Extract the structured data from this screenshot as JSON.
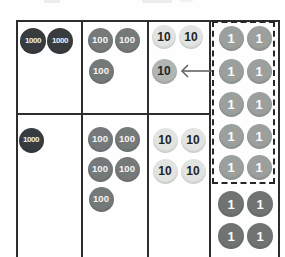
{
  "palette": {
    "background": "#fefefe",
    "table_border": "#2d2d2d",
    "dashed_box_border": "#262626",
    "arrow": "#666666",
    "disk_kinds": {
      "thousand": {
        "bg": "#383c3e",
        "fg": "#f2f2f2",
        "font_px": 8
      },
      "hundred": {
        "bg": "#75797a",
        "fg": "#f5f5f5",
        "font_px": 9.5
      },
      "ten": {
        "bg": "#e2e4e2",
        "fg": "#222526",
        "font_px": 12
      },
      "ten_moved": {
        "bg": "#b2b6b3",
        "fg": "#222526",
        "font_px": 12
      },
      "one_light": {
        "bg": "#9ba09d",
        "fg": "#fdfdfd",
        "font_px": 13
      },
      "one_dark": {
        "bg": "#6f7472",
        "fg": "#fdfdfd",
        "font_px": 13
      }
    }
  },
  "chart": {
    "type": "place-value-disk-diagram",
    "columns": [
      "thousands",
      "hundreds",
      "tens",
      "ones"
    ],
    "rows": [
      {
        "thousands": 2,
        "hundreds": 3,
        "tens": 2,
        "tens_regrouped_in": 1,
        "ones_in_dashed_box": 10
      },
      {
        "thousands": 1,
        "hundreds": 5,
        "tens": 4,
        "ones": 4
      }
    ],
    "dashed_box_note": "ten ones grouped, arrow shows regrouping into one ten"
  },
  "disks": [
    {
      "label": "1000",
      "kind": "thousand",
      "cx": 33,
      "cy": 41,
      "d": 26
    },
    {
      "label": "1000",
      "kind": "thousand",
      "cx": 60,
      "cy": 41,
      "d": 26
    },
    {
      "label": "100",
      "kind": "hundred",
      "cx": 100,
      "cy": 40,
      "d": 25
    },
    {
      "label": "100",
      "kind": "hundred",
      "cx": 127,
      "cy": 40,
      "d": 25
    },
    {
      "label": "100",
      "kind": "hundred",
      "cx": 101,
      "cy": 71,
      "d": 25
    },
    {
      "label": "10",
      "kind": "ten",
      "cx": 164,
      "cy": 37,
      "d": 24
    },
    {
      "label": "10",
      "kind": "ten",
      "cx": 191,
      "cy": 37,
      "d": 24
    },
    {
      "label": "10",
      "kind": "ten_moved",
      "cx": 164,
      "cy": 71,
      "d": 25
    },
    {
      "label": "1",
      "kind": "one_light",
      "cx": 231,
      "cy": 38,
      "d": 25
    },
    {
      "label": "1",
      "kind": "one_light",
      "cx": 259,
      "cy": 38,
      "d": 25
    },
    {
      "label": "1",
      "kind": "one_light",
      "cx": 231,
      "cy": 71,
      "d": 25
    },
    {
      "label": "1",
      "kind": "one_light",
      "cx": 259,
      "cy": 71,
      "d": 25
    },
    {
      "label": "1",
      "kind": "one_light",
      "cx": 231,
      "cy": 104,
      "d": 25
    },
    {
      "label": "1",
      "kind": "one_light",
      "cx": 259,
      "cy": 104,
      "d": 25
    },
    {
      "label": "1",
      "kind": "one_light",
      "cx": 231,
      "cy": 136,
      "d": 25
    },
    {
      "label": "1",
      "kind": "one_light",
      "cx": 259,
      "cy": 136,
      "d": 25
    },
    {
      "label": "1",
      "kind": "one_light",
      "cx": 231,
      "cy": 167,
      "d": 25
    },
    {
      "label": "1",
      "kind": "one_light",
      "cx": 259,
      "cy": 167,
      "d": 25
    },
    {
      "label": "1",
      "kind": "one_dark",
      "cx": 231,
      "cy": 204,
      "d": 26
    },
    {
      "label": "1",
      "kind": "one_dark",
      "cx": 260,
      "cy": 204,
      "d": 26
    },
    {
      "label": "1",
      "kind": "one_dark",
      "cx": 231,
      "cy": 236,
      "d": 26
    },
    {
      "label": "1",
      "kind": "one_dark",
      "cx": 260,
      "cy": 236,
      "d": 26
    },
    {
      "label": "1000",
      "kind": "thousand",
      "cx": 31,
      "cy": 140,
      "d": 25
    },
    {
      "label": "100",
      "kind": "hundred",
      "cx": 100,
      "cy": 139,
      "d": 25
    },
    {
      "label": "100",
      "kind": "hundred",
      "cx": 127,
      "cy": 139,
      "d": 25
    },
    {
      "label": "100",
      "kind": "hundred",
      "cx": 100,
      "cy": 169,
      "d": 25
    },
    {
      "label": "100",
      "kind": "hundred",
      "cx": 127,
      "cy": 169,
      "d": 25
    },
    {
      "label": "100",
      "kind": "hundred",
      "cx": 101,
      "cy": 199,
      "d": 25
    },
    {
      "label": "10",
      "kind": "ten",
      "cx": 165,
      "cy": 140,
      "d": 25
    },
    {
      "label": "10",
      "kind": "ten",
      "cx": 193,
      "cy": 140,
      "d": 25
    },
    {
      "label": "10",
      "kind": "ten",
      "cx": 165,
      "cy": 171,
      "d": 25
    },
    {
      "label": "10",
      "kind": "ten",
      "cx": 193,
      "cy": 171,
      "d": 25
    }
  ],
  "arrow": {
    "tip_x": 182,
    "tail_x": 212,
    "y": 71,
    "head": 6
  }
}
